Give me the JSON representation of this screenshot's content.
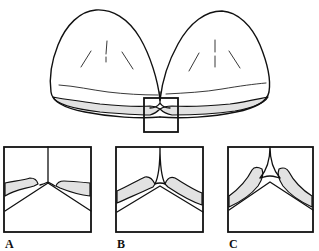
{
  "figure": {
    "type": "schematic illustration",
    "colors": {
      "line": "#111111",
      "shading": "#e2e2e2",
      "background": "#ffffff"
    }
  },
  "panels": [
    {
      "id": "A",
      "label": "A"
    },
    {
      "id": "B",
      "label": "B"
    },
    {
      "id": "C",
      "label": "C"
    }
  ]
}
